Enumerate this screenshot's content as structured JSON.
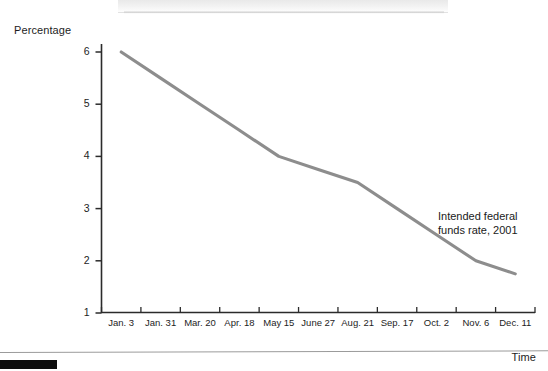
{
  "chart_data": {
    "type": "line",
    "title": "",
    "xlabel": "Time",
    "ylabel": "Percentage",
    "ylim": [
      1,
      6
    ],
    "yticks": [
      1,
      2,
      3,
      4,
      5,
      6
    ],
    "ytick_labels": [
      "1",
      "2",
      "3",
      "4",
      "5",
      "6"
    ],
    "grid": false,
    "legend": "none",
    "categories": [
      "Jan. 3",
      "Jan. 31",
      "Mar. 20",
      "Apr. 18",
      "May 15",
      "June 27",
      "Aug. 21",
      "Sep. 17",
      "Oct. 2",
      "Nov. 6",
      "Dec. 11"
    ],
    "series": [
      {
        "name": "Intended federal funds rate, 2001",
        "values": [
          6.0,
          5.5,
          5.0,
          4.5,
          4.0,
          3.75,
          3.5,
          3.0,
          2.5,
          2.0,
          1.75
        ],
        "color": "#8d8d8d"
      }
    ],
    "annotations": [
      {
        "name": "series-label",
        "line1": "Intended federal",
        "line2": "funds rate, 2001"
      }
    ]
  },
  "figure": {
    "y_axis_title": "Percentage",
    "x_axis_title": "Time"
  }
}
